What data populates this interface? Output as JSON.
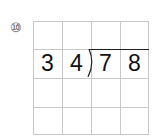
{
  "problem": {
    "number_label": "⑩",
    "divisor": [
      "3",
      "4"
    ],
    "dividend": [
      "7",
      "8"
    ]
  },
  "grid": {
    "rows": 4,
    "cols": 4
  },
  "colors": {
    "grid_line": "#c8c8c8",
    "text": "#111111",
    "division_bar": "#222222"
  }
}
